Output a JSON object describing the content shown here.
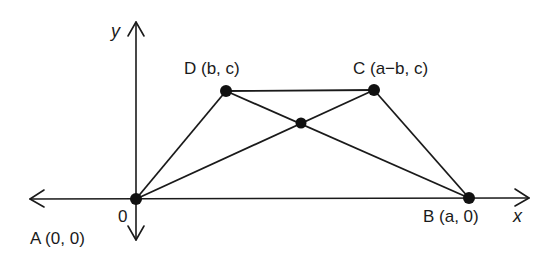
{
  "diagram": {
    "title": "",
    "axes": {
      "x_label": "x",
      "y_label": "y",
      "origin_label": "0"
    },
    "points": {
      "A": {
        "label": "A (0, 0)",
        "x": 136,
        "y": 199
      },
      "B": {
        "label": "B (a, 0)",
        "x": 469,
        "y": 198
      },
      "C": {
        "label": "C (a−b, c)",
        "x": 374,
        "y": 90
      },
      "D": {
        "label": "D (b, c)",
        "x": 226,
        "y": 91
      },
      "M": {
        "label": "",
        "x": 301,
        "y": 123
      }
    },
    "segments": [
      "AD",
      "DC",
      "CB",
      "AC",
      "DB"
    ],
    "colors": {
      "stroke": "#1a1a1a",
      "background": "#ffffff"
    }
  }
}
